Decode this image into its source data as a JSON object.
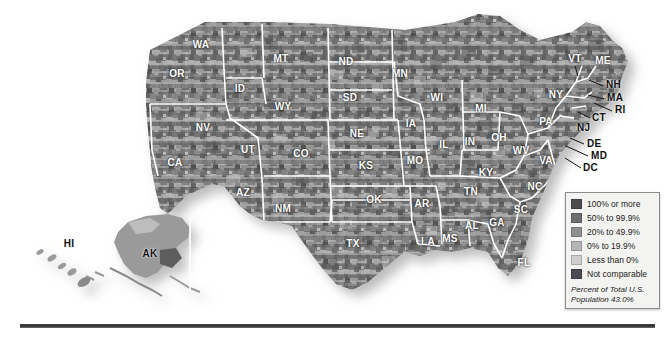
{
  "figure": {
    "type": "choropleth-map",
    "region": "United States",
    "subdivision": "county"
  },
  "legend": {
    "title": "",
    "entries": [
      {
        "label": "100% or more",
        "color": "#4d4d4d"
      },
      {
        "label": "50% to 99.9%",
        "color": "#6e6e6e"
      },
      {
        "label": "20% to 49.9%",
        "color": "#8f8f8f"
      },
      {
        "label": "0% to 19.9%",
        "color": "#b5b5b5"
      },
      {
        "label": "Less than 0%",
        "color": "#cfcfcf"
      },
      {
        "label": "Not comparable",
        "color": "#4a4a52"
      }
    ],
    "note_line1": "Percent of Total U.S.",
    "note_line2": "Population 43.0%"
  },
  "states": [
    {
      "abbr": "WA",
      "x": 201,
      "y": 44,
      "tone": "light"
    },
    {
      "abbr": "OR",
      "x": 177,
      "y": 73,
      "tone": "light"
    },
    {
      "abbr": "ID",
      "x": 240,
      "y": 88,
      "tone": "light"
    },
    {
      "abbr": "MT",
      "x": 281,
      "y": 58,
      "tone": "light"
    },
    {
      "abbr": "WY",
      "x": 283,
      "y": 106,
      "tone": "light"
    },
    {
      "abbr": "NV",
      "x": 203,
      "y": 127,
      "tone": "light"
    },
    {
      "abbr": "UT",
      "x": 248,
      "y": 149,
      "tone": "light"
    },
    {
      "abbr": "CA",
      "x": 175,
      "y": 162,
      "tone": "light"
    },
    {
      "abbr": "AZ",
      "x": 243,
      "y": 192,
      "tone": "light"
    },
    {
      "abbr": "CO",
      "x": 301,
      "y": 153,
      "tone": "light"
    },
    {
      "abbr": "NM",
      "x": 283,
      "y": 208,
      "tone": "light"
    },
    {
      "abbr": "ND",
      "x": 346,
      "y": 61,
      "tone": "light"
    },
    {
      "abbr": "SD",
      "x": 350,
      "y": 97,
      "tone": "light"
    },
    {
      "abbr": "NE",
      "x": 357,
      "y": 133,
      "tone": "light"
    },
    {
      "abbr": "KS",
      "x": 366,
      "y": 165,
      "tone": "light"
    },
    {
      "abbr": "OK",
      "x": 374,
      "y": 199,
      "tone": "light"
    },
    {
      "abbr": "TX",
      "x": 353,
      "y": 243,
      "tone": "light"
    },
    {
      "abbr": "MN",
      "x": 400,
      "y": 73,
      "tone": "light"
    },
    {
      "abbr": "IA",
      "x": 411,
      "y": 123,
      "tone": "light"
    },
    {
      "abbr": "MO",
      "x": 415,
      "y": 160,
      "tone": "light"
    },
    {
      "abbr": "AR",
      "x": 422,
      "y": 203,
      "tone": "light"
    },
    {
      "abbr": "LA",
      "x": 428,
      "y": 241,
      "tone": "light"
    },
    {
      "abbr": "MS",
      "x": 450,
      "y": 238,
      "tone": "light"
    },
    {
      "abbr": "WI",
      "x": 437,
      "y": 97,
      "tone": "light"
    },
    {
      "abbr": "IL",
      "x": 444,
      "y": 144,
      "tone": "light"
    },
    {
      "abbr": "MI",
      "x": 481,
      "y": 108,
      "tone": "light"
    },
    {
      "abbr": "IN",
      "x": 470,
      "y": 141,
      "tone": "light"
    },
    {
      "abbr": "OH",
      "x": 499,
      "y": 137,
      "tone": "light"
    },
    {
      "abbr": "KY",
      "x": 486,
      "y": 172,
      "tone": "light"
    },
    {
      "abbr": "TN",
      "x": 471,
      "y": 191,
      "tone": "light"
    },
    {
      "abbr": "AL",
      "x": 472,
      "y": 225,
      "tone": "light"
    },
    {
      "abbr": "GA",
      "x": 497,
      "y": 222,
      "tone": "light"
    },
    {
      "abbr": "FL",
      "x": 524,
      "y": 262,
      "tone": "light"
    },
    {
      "abbr": "SC",
      "x": 521,
      "y": 209,
      "tone": "light"
    },
    {
      "abbr": "NC",
      "x": 535,
      "y": 186,
      "tone": "light"
    },
    {
      "abbr": "VA",
      "x": 546,
      "y": 160,
      "tone": "light"
    },
    {
      "abbr": "WV",
      "x": 521,
      "y": 150,
      "tone": "light"
    },
    {
      "abbr": "PA",
      "x": 546,
      "y": 121,
      "tone": "light"
    },
    {
      "abbr": "NY",
      "x": 556,
      "y": 94,
      "tone": "light"
    },
    {
      "abbr": "VT",
      "x": 575,
      "y": 58,
      "tone": "light"
    },
    {
      "abbr": "ME",
      "x": 603,
      "y": 60,
      "tone": "light"
    },
    {
      "abbr": "HI",
      "x": 69,
      "y": 243,
      "tone": "dark"
    },
    {
      "abbr": "AK",
      "x": 150,
      "y": 253,
      "tone": "dark"
    }
  ],
  "callout_states": [
    {
      "abbr": "NH",
      "x": 606,
      "y": 84
    },
    {
      "abbr": "MA",
      "x": 607,
      "y": 97
    },
    {
      "abbr": "RI",
      "x": 615,
      "y": 109
    },
    {
      "abbr": "CT",
      "x": 592,
      "y": 117
    },
    {
      "abbr": "NJ",
      "x": 577,
      "y": 127
    },
    {
      "abbr": "DE",
      "x": 587,
      "y": 143
    },
    {
      "abbr": "MD",
      "x": 591,
      "y": 155
    },
    {
      "abbr": "DC",
      "x": 583,
      "y": 167
    }
  ]
}
